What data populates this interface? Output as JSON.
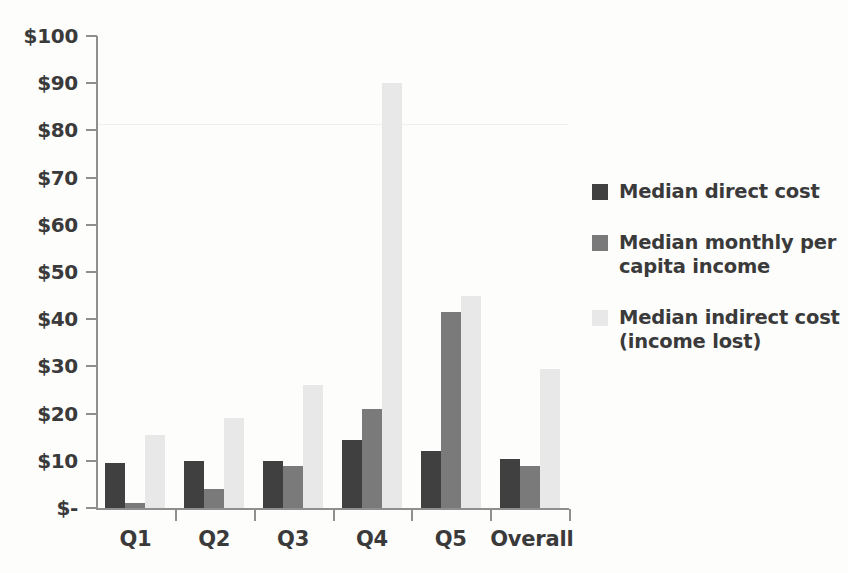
{
  "chart_data": {
    "type": "bar",
    "title": "",
    "subtitle": "",
    "xlabel": "",
    "ylabel": "",
    "categories": [
      "Q1",
      "Q2",
      "Q3",
      "Q4",
      "Q5",
      "Overall"
    ],
    "series": [
      {
        "name": "Median direct cost",
        "color": "#404040",
        "values": [
          9.5,
          10,
          10,
          14.5,
          12,
          10.3
        ]
      },
      {
        "name": "Median monthly per capita income",
        "color": "#7a7a7a",
        "values": [
          1,
          4,
          9,
          21,
          41.5,
          9
        ]
      },
      {
        "name": "Median indirect cost (income lost)",
        "color": "#e8e8e8",
        "values": [
          15.5,
          19,
          26,
          90,
          45,
          29.5
        ]
      }
    ],
    "ylim": [
      0,
      100
    ],
    "ytick_values": [
      0,
      10,
      20,
      30,
      40,
      50,
      60,
      70,
      80,
      90,
      100
    ],
    "ytick_labels": [
      "$-",
      "$10",
      "$20",
      "$30",
      "$40",
      "$50",
      "$60",
      "$70",
      "$80",
      "$90",
      "$100"
    ],
    "grid": false,
    "legend_position": "right"
  },
  "legend": {
    "entries": [
      {
        "label": "Median direct cost",
        "color": "#404040"
      },
      {
        "label": "Median monthly per\ncapita income",
        "color": "#7a7a7a"
      },
      {
        "label": "Median indirect cost\n(income lost)",
        "color": "#e8e8e8"
      }
    ]
  },
  "axis": {
    "text_color": "#3a3a3a",
    "line_color": "#8f8f8f"
  },
  "background": {
    "color": "#fdfdfc"
  }
}
